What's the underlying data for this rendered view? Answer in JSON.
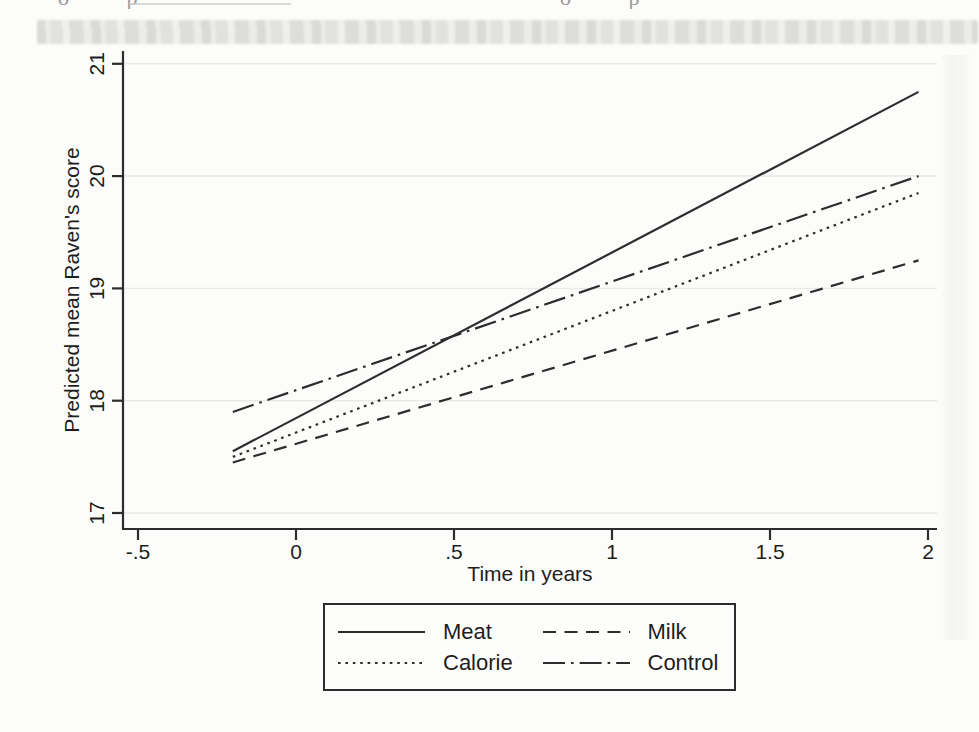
{
  "page": {
    "artifacts": {
      "fragment_left": "o p",
      "fragment_right": "o p"
    }
  },
  "chart_data": {
    "type": "line",
    "title": "",
    "xlabel": "Time in years",
    "ylabel": "Predicted mean Raven's score",
    "x_ticks": [
      -0.5,
      0,
      0.5,
      1,
      1.5,
      2
    ],
    "x_tick_labels": [
      "-.5",
      "0",
      ".5",
      "1",
      "1.5",
      "2"
    ],
    "y_ticks": [
      17,
      18,
      19,
      20,
      21
    ],
    "y_tick_labels": [
      "17",
      "18",
      "19",
      "20",
      "21"
    ],
    "xlim": [
      -0.55,
      2.03
    ],
    "ylim": [
      16.85,
      21.1
    ],
    "grid": "horizontal-faint",
    "ink_color": "#2d2d2d",
    "grid_color": "#e9e9e7",
    "series": [
      {
        "name": "Meat",
        "style": "solid",
        "points": [
          [
            -0.2,
            17.55
          ],
          [
            1.97,
            20.75
          ]
        ]
      },
      {
        "name": "Calorie",
        "style": "dotted",
        "points": [
          [
            -0.2,
            17.5
          ],
          [
            1.97,
            19.85
          ]
        ]
      },
      {
        "name": "Milk",
        "style": "dashed",
        "points": [
          [
            -0.2,
            17.45
          ],
          [
            1.97,
            19.25
          ]
        ]
      },
      {
        "name": "Control",
        "style": "dash-dot",
        "points": [
          [
            -0.2,
            17.9
          ],
          [
            1.97,
            20.0
          ]
        ]
      }
    ],
    "legend": {
      "position": "bottom-center",
      "rows": [
        [
          "Meat",
          "Milk"
        ],
        [
          "Calorie",
          "Control"
        ]
      ]
    }
  }
}
